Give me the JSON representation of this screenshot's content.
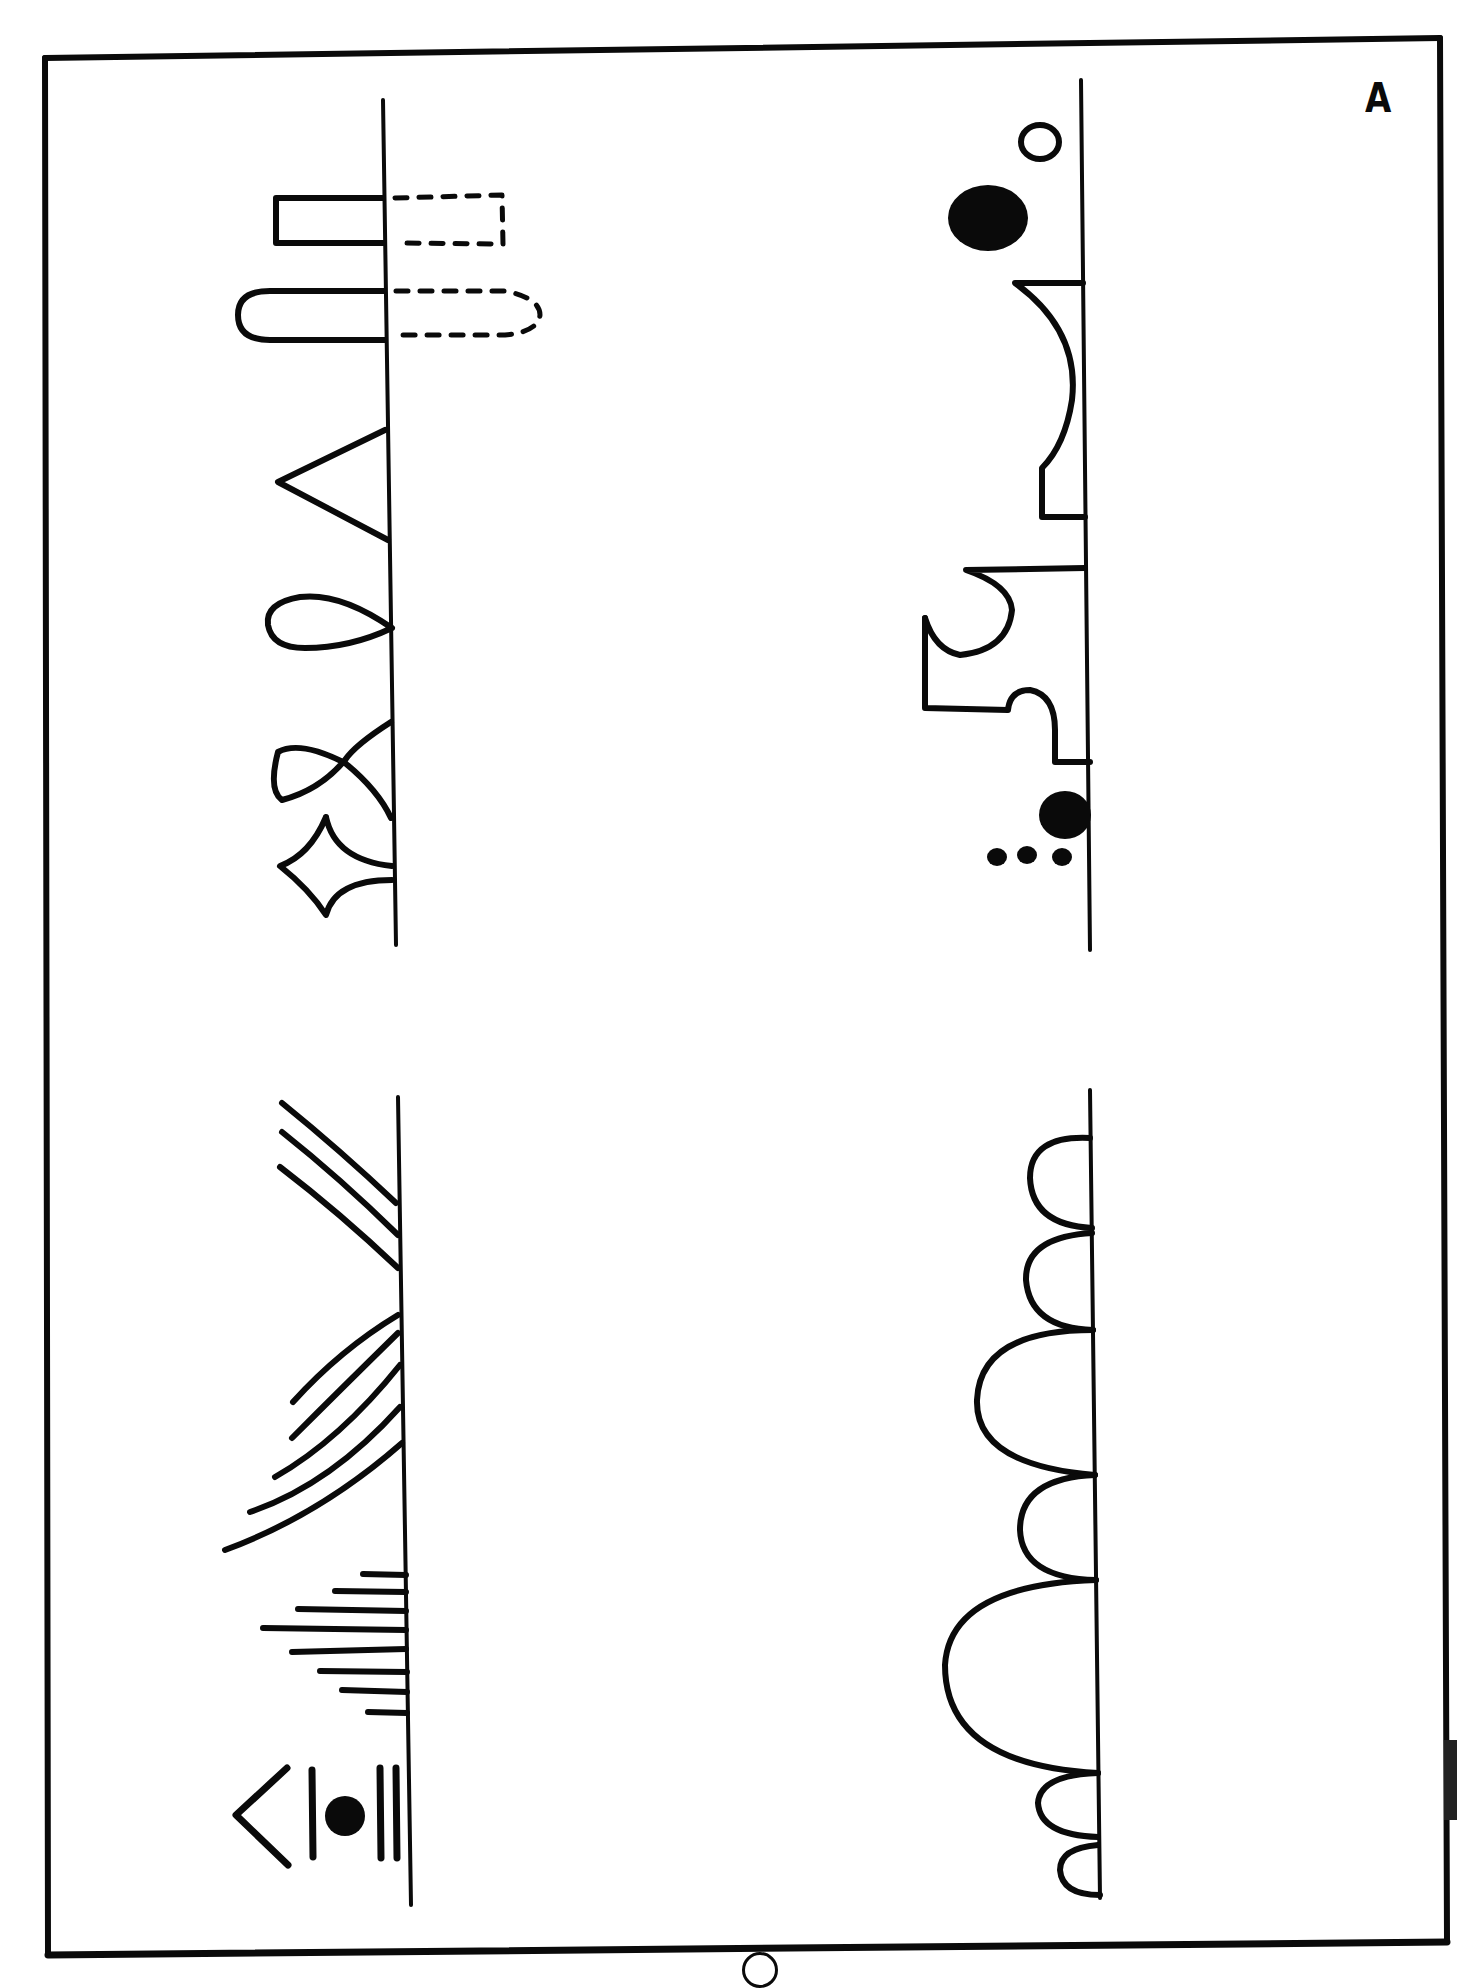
{
  "document": {
    "corner_label": "A",
    "description": "Pattern drawing worksheet (rotated 90°): four baselines, each with hand-drawn pattern motifs attached",
    "colors": {
      "ink": "#0a0a0a",
      "paper": "#ffffff"
    }
  },
  "panels": [
    {
      "id": "top-left",
      "baseline": {
        "x": 390,
        "y1": 100,
        "y2": 945
      },
      "motifs": [
        "rectangle-loop-with-dashed-mirror",
        "rounded-loop-with-dashed-mirror",
        "triangle",
        "teardrop-loop",
        "crossed-loop",
        "four-point-star"
      ]
    },
    {
      "id": "top-right",
      "baseline": {
        "x": 1085,
        "y1": 78,
        "y2": 950
      },
      "motifs": [
        "small-open-circle",
        "large-filled-dot",
        "arch-with-notch",
        "hook-curve",
        "step-bump",
        "filled-dot",
        "three-small-dots"
      ]
    },
    {
      "id": "bottom-left",
      "baseline": {
        "x": 400,
        "y1": 1097,
        "y2": 1905
      },
      "motifs": [
        "three-diagonal-lines",
        "five-curved-lines",
        "eight-horizontal-ticks",
        "chevron-bar-dot-double-bar"
      ]
    },
    {
      "id": "bottom-right",
      "baseline": {
        "x": 1095,
        "y1": 1090,
        "y2": 1898
      },
      "motifs": [
        "scallop-small",
        "scallop-small",
        "scallop-large",
        "scallop-medium",
        "scallop-large",
        "scallop-small",
        "scallop-tiny"
      ]
    }
  ]
}
